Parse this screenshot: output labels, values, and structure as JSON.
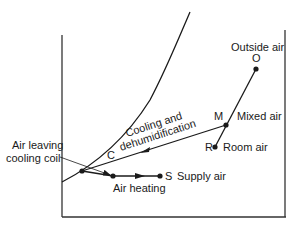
{
  "diagram": {
    "type": "psychrometric-process",
    "labels": {
      "outside_air": "Outside air",
      "point_o": "O",
      "point_m": "M",
      "mixed_air": "Mixed air",
      "point_r": "R",
      "room_air": "Room air",
      "point_c": "C",
      "point_s": "S",
      "supply_air": "Supply air",
      "air_heating": "Air heating",
      "cooling_line1": "Cooling and",
      "cooling_line2": "dehumidification",
      "leaving_line1": "Air leaving",
      "leaving_line2": "cooling coil"
    },
    "colors": {
      "line": "#1a1a1a",
      "axis": "#333333",
      "background": "#ffffff"
    }
  }
}
